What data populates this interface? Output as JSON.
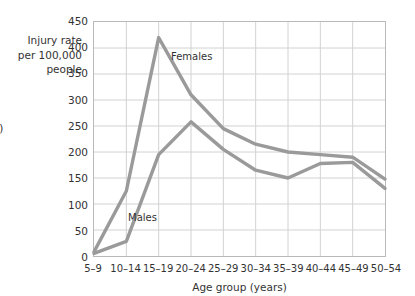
{
  "axis_title_y": "Injury rate\nper 100,000\npeople",
  "caption_fragment": ".)",
  "axis_title_x": "Age group (years)",
  "series_labels": {
    "females": "Females",
    "males": "Males"
  },
  "colors": {
    "line": "#9a9a9a",
    "grid": "#d2d2d2",
    "frame": "#b9b9b9",
    "text": "#333333"
  },
  "chart_data": {
    "type": "line",
    "title": "",
    "xlabel": "Age group (years)",
    "ylabel": "Injury rate per 100,000 people",
    "categories": [
      "5–9",
      "10–14",
      "15–19",
      "20–24",
      "25–29",
      "30–34",
      "35–39",
      "40–44",
      "45–49",
      "50–54"
    ],
    "ylim": [
      0,
      450
    ],
    "ytick_values": [
      0,
      50,
      100,
      150,
      200,
      250,
      300,
      350,
      400,
      450
    ],
    "ytick_labels": [
      "0",
      "50",
      "100",
      "150",
      "200",
      "250",
      "300",
      "350",
      "400",
      "450"
    ],
    "grid": true,
    "legend": "inline-annotations",
    "series": [
      {
        "name": "Females",
        "values": [
          8,
          125,
          420,
          310,
          245,
          215,
          200,
          195,
          190,
          148
        ]
      },
      {
        "name": "Males",
        "values": [
          5,
          28,
          195,
          258,
          205,
          165,
          150,
          178,
          180,
          130
        ]
      }
    ]
  }
}
